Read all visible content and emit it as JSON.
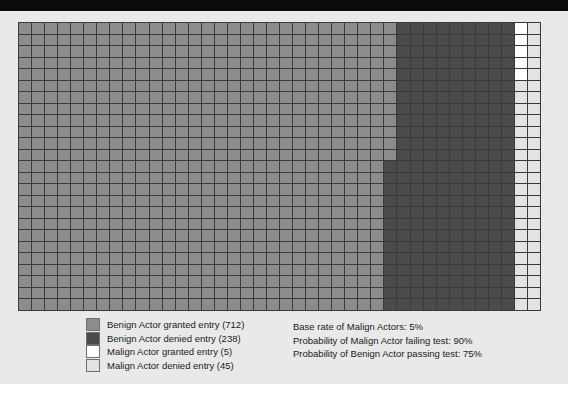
{
  "figure": {
    "background_color": "#e9e9e9",
    "top_bar_color": "#0b0b0b",
    "grid_line_color": "#3a3a3a"
  },
  "grid": {
    "columns": 40,
    "rows": 25,
    "total_cells": 1000,
    "note": "Unit-square icon array: each cell represents one actor out of 1000."
  },
  "legend": {
    "items": [
      {
        "label": "Benign Actor granted entry (712)",
        "name": "benign-granted",
        "count": 712,
        "color": "#8c8c8c"
      },
      {
        "label": "Benign Actor denied entry (238)",
        "name": "benign-denied",
        "count": 238,
        "color": "#4b4b4b"
      },
      {
        "label": "Malign Actor granted entry (5)",
        "name": "malign-granted",
        "count": 5,
        "color": "#ffffff"
      },
      {
        "label": "Malign Actor denied entry (45)",
        "name": "malign-denied",
        "count": 45,
        "color": "#e3e3e3"
      }
    ]
  },
  "stats": {
    "lines": [
      "Base rate of Malign Actors: 5%",
      "Probability of Malign Actor failing test: 90%",
      "Probability of Benign Actor passing test: 75%"
    ],
    "base_rate_malign": "5%",
    "prob_malign_failing_test": "90%",
    "prob_benign_passing_test": "75%"
  },
  "chart_data": {
    "type": "heatmap",
    "title": "",
    "xlabel": "",
    "ylabel": "",
    "categories": [
      "Benign Actor granted entry",
      "Benign Actor denied entry",
      "Malign Actor granted entry",
      "Malign Actor denied entry"
    ],
    "values": [
      712,
      238,
      5,
      45
    ],
    "colors": [
      "#8c8c8c",
      "#4b4b4b",
      "#ffffff",
      "#e3e3e3"
    ],
    "grid_columns": 40,
    "grid_rows": 25,
    "total": 1000,
    "legend_position": "bottom-left",
    "grid": true,
    "annotations": [
      "Base rate of Malign Actors: 5%",
      "Probability of Malign Actor failing test: 90%",
      "Probability of Benign Actor passing test: 75%"
    ]
  }
}
